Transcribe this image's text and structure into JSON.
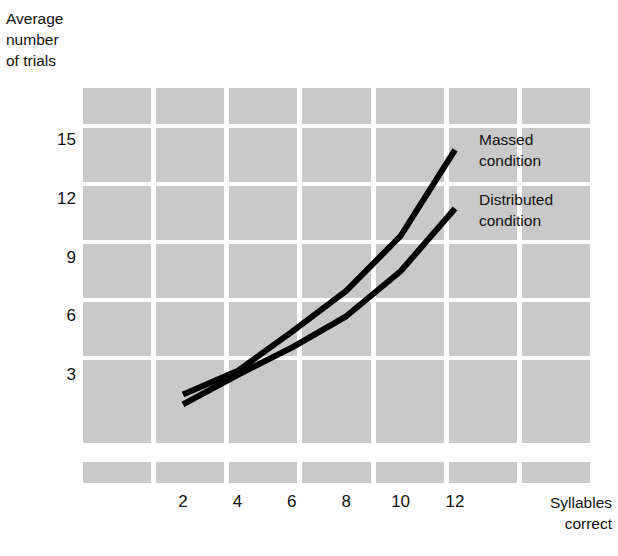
{
  "chart_data": {
    "type": "line",
    "title": "",
    "xlabel": "Syllables correct",
    "ylabel": "Average number of trials",
    "x": [
      2,
      4,
      6,
      8,
      10,
      12
    ],
    "xlim": [
      1,
      13
    ],
    "ylim": [
      0,
      16.5
    ],
    "xticks": [
      "2",
      "4",
      "6",
      "8",
      "10",
      "12"
    ],
    "yticks": [
      "3",
      "6",
      "9",
      "12",
      "15"
    ],
    "grid": true,
    "legend_position": "inline-right-of-lines",
    "series": [
      {
        "name": "Massed condition",
        "values": [
          2.0,
          3.2,
          5.2,
          7.3,
          10.1,
          14.5
        ]
      },
      {
        "name": "Distributed condition",
        "values": [
          1.5,
          3.0,
          4.4,
          6.0,
          8.3,
          11.5
        ]
      }
    ],
    "annotations": [
      {
        "text": "Massed\ncondition"
      },
      {
        "text": "Distributed\ncondition"
      }
    ]
  },
  "axes": {
    "y_title": "Average\nnumber\nof trials",
    "x_title": "Syllables\ncorrect",
    "y_tick_labels": [
      "15",
      "12",
      "9",
      "6",
      "3"
    ],
    "x_tick_labels": [
      "2",
      "4",
      "6",
      "8",
      "10",
      "12"
    ]
  },
  "legend": {
    "massed_label": "Massed\ncondition",
    "distributed_label": "Distributed\ncondition"
  },
  "colors": {
    "grid_block": "#c9c9c9",
    "background": "#ffffff",
    "line": "#000000",
    "text": "#111111"
  }
}
